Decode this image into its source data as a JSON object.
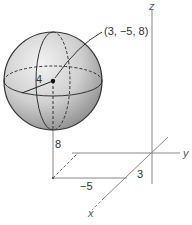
{
  "diagram": {
    "type": "sphere-in-3d-coordinates",
    "center_label": "(3, −5, 8)",
    "radius_label": "4",
    "axes": {
      "x_label": "x",
      "y_label": "y",
      "z_label": "z"
    },
    "projection_labels": {
      "z_value": "8",
      "y_value": "−5",
      "x_value": "3"
    },
    "colors": {
      "sphere_fill": "#c8c8c8",
      "sphere_edge": "#333333",
      "axis_line": "#888888",
      "text": "#333333"
    }
  }
}
